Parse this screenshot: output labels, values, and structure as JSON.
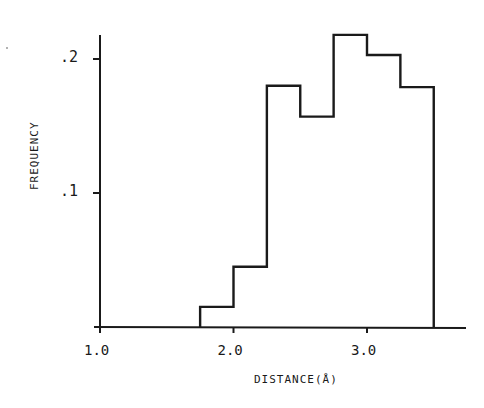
{
  "chart_data": {
    "type": "bar",
    "style": "step-histogram",
    "title": "",
    "xlabel": "DISTANCE(Å)",
    "ylabel": "FREQUENCY",
    "xlim": [
      1.0,
      3.9
    ],
    "ylim": [
      0,
      0.22
    ],
    "grid": false,
    "legend": null,
    "xticks": [
      {
        "value": 1.0,
        "label": "1.0"
      },
      {
        "value": 2.0,
        "label": "2.0"
      },
      {
        "value": 3.0,
        "label": "3.0"
      }
    ],
    "yticks": [
      {
        "value": 0.1,
        "label": ".1"
      },
      {
        "value": 0.2,
        "label": ".2"
      }
    ],
    "bin_edges": [
      1.75,
      2.0,
      2.25,
      2.5,
      2.75,
      3.0,
      3.25,
      3.5
    ],
    "categories": [
      "1.75-2.00",
      "2.00-2.25",
      "2.25-2.50",
      "2.50-2.75",
      "2.75-3.00",
      "3.00-3.25",
      "3.25-3.50"
    ],
    "values": [
      0.015,
      0.045,
      0.18,
      0.157,
      0.218,
      0.203,
      0.179
    ]
  }
}
